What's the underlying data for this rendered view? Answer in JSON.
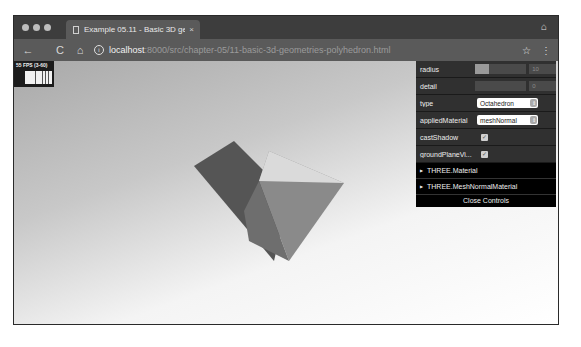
{
  "browser": {
    "tab": {
      "title": "Example 05.11 - Basic 3D geometries",
      "close_glyph": "×"
    },
    "toolbar": {
      "back_glyph": "←",
      "reload_glyph": "C",
      "home_glyph": "⌂",
      "info_glyph": "i",
      "url_host": "localhost",
      "url_path": ":8000/src/chapter-05/11-basic-3d-geometries-polyhedron.html",
      "star_glyph": "☆",
      "menu_glyph": "⋮"
    },
    "incognito_glyph": "⌂"
  },
  "stats": {
    "label": "55 FPS (3-60)"
  },
  "controls": {
    "radius": {
      "label": "radius",
      "value": "10",
      "fill_percent": 27
    },
    "detail": {
      "label": "detail",
      "value": "0",
      "fill_percent": 0
    },
    "type": {
      "label": "type",
      "value": "Octahedron"
    },
    "appliedMaterial": {
      "label": "appliedMaterial",
      "value": "meshNormal"
    },
    "castShadow": {
      "label": "castShadow",
      "checked": "✓"
    },
    "groundPlaneVisible": {
      "label": "groundPlaneVi...",
      "checked": "✓"
    },
    "folders": [
      {
        "label": "THREE.Material"
      },
      {
        "label": "THREE.MeshNormalMaterial"
      }
    ],
    "close_label": "Close Controls",
    "select_arrow": "⇕"
  }
}
